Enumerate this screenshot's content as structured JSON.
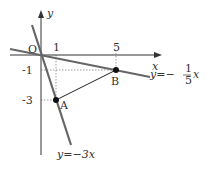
{
  "diagram": {
    "axes": {
      "x_label": "x",
      "y_label": "y",
      "origin_label": "O"
    },
    "ticks": {
      "x": [
        "1",
        "5"
      ],
      "y": [
        "-1",
        "-3"
      ]
    },
    "points": [
      {
        "label": "A",
        "x": 1,
        "y": -3
      },
      {
        "label": "B",
        "x": 5,
        "y": -1
      }
    ],
    "lines": [
      {
        "label": "y=−3x",
        "slope": -3
      },
      {
        "label_prefix": "y=−",
        "frac_num": "1",
        "frac_den": "5",
        "label_suffix": "x",
        "slope": -0.2
      }
    ],
    "colors": {
      "lines": "#555555",
      "axes": "#333333",
      "segment": "#222222"
    }
  }
}
